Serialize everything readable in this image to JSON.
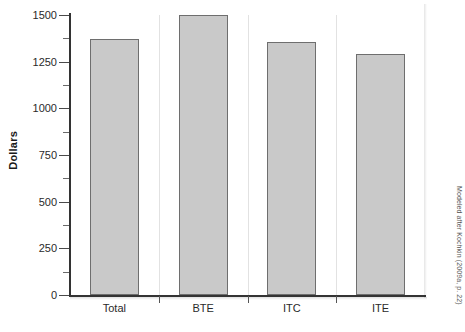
{
  "chart_data": {
    "type": "bar",
    "title": "",
    "subtitle": "",
    "xlabel": "",
    "ylabel": "Dollars",
    "categories": [
      "Total",
      "BTE",
      "ITC",
      "ITE"
    ],
    "values": [
      1370,
      1500,
      1355,
      1290
    ],
    "series": [
      {
        "name": "Dollars",
        "values": [
          1370,
          1500,
          1355,
          1290
        ]
      }
    ],
    "ylim": [
      0,
      1500
    ],
    "ytick_labels": [
      "0",
      "250",
      "500",
      "750",
      "1000",
      "1250",
      "1500"
    ],
    "ytick_values": [
      0,
      250,
      500,
      750,
      1000,
      1250,
      1500
    ],
    "yminor_values": [
      125,
      375,
      625,
      875,
      1125,
      1375
    ],
    "grid": false,
    "legend": false,
    "legend_position": "none",
    "bar_fill_color": "#c9c9c9",
    "bar_border_color": "#6e6e6e",
    "axis_color": "#333333"
  },
  "axis": {
    "y_title": "Dollars"
  },
  "notes": {
    "source": "Modeled after Kochkin (2009a, p. 22)"
  }
}
